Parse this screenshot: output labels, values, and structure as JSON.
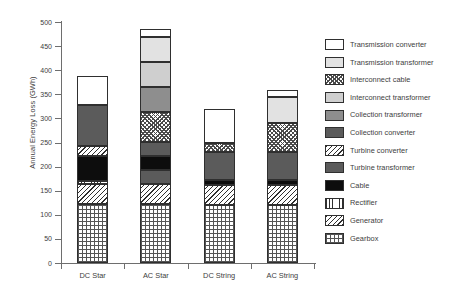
{
  "chart_data": {
    "type": "bar",
    "stacked": true,
    "title": "",
    "xlabel": "",
    "ylabel": "Annual Energy Loss (GWh)",
    "ylim": [
      0,
      500
    ],
    "yticks": [
      0,
      50,
      100,
      150,
      200,
      250,
      300,
      350,
      400,
      450,
      500
    ],
    "grid": false,
    "legend_position": "right",
    "categories": [
      "DC Star",
      "AC Star",
      "DC String",
      "AC String"
    ],
    "series": [
      {
        "name": "Gearbox",
        "pattern": "grid",
        "values": [
          122,
          122,
          121,
          121
        ]
      },
      {
        "name": "Generator",
        "pattern": "diag",
        "values": [
          41,
          41,
          40,
          40
        ]
      },
      {
        "name": "Rectifier",
        "pattern": "vert",
        "values": [
          8,
          0,
          0,
          0
        ]
      },
      {
        "name": "Cable",
        "pattern": "black",
        "values": [
          51,
          30,
          11,
          11
        ]
      },
      {
        "name": "Turbine transformer",
        "pattern": "darkgray",
        "values": [
          0,
          29,
          0,
          59
        ]
      },
      {
        "name": "Turbine converter",
        "pattern": "diag",
        "values": [
          21,
          62,
          18,
          60
        ]
      },
      {
        "name": "Collection converter",
        "pattern": "darkgray",
        "values": [
          84,
          30,
          58,
          0
        ]
      },
      {
        "name": "Collection transformer",
        "pattern": "gray",
        "values": [
          0,
          51,
          0,
          0
        ]
      },
      {
        "name": "Interconnect transformer",
        "pattern": "midgray",
        "values": [
          0,
          52,
          0,
          0
        ]
      },
      {
        "name": "Interconnect cable",
        "pattern": "checker",
        "values": [
          0,
          0,
          0,
          0
        ]
      },
      {
        "name": "Transmission transformer",
        "pattern": "lightgray",
        "values": [
          0,
          52,
          0,
          53
        ]
      },
      {
        "name": "Transmission converter",
        "pattern": "white",
        "values": [
          60,
          16,
          72,
          14
        ]
      }
    ],
    "totals": [
      387,
      485,
      320,
      358
    ],
    "bars": [
      {
        "category": "DC Star",
        "total": 387,
        "segments": [
          {
            "name": "Gearbox",
            "pattern": "grid",
            "start": 0,
            "end": 122,
            "value": 122
          },
          {
            "name": "Generator",
            "pattern": "diag",
            "start": 122,
            "end": 163,
            "value": 41
          },
          {
            "name": "Rectifier",
            "pattern": "vert",
            "start": 163,
            "end": 171,
            "value": 8
          },
          {
            "name": "Cable",
            "pattern": "black",
            "start": 171,
            "end": 222,
            "value": 51
          },
          {
            "name": "Turbine converter",
            "pattern": "diag",
            "start": 222,
            "end": 243,
            "value": 21
          },
          {
            "name": "Collection converter",
            "pattern": "darkgray",
            "start": 243,
            "end": 327,
            "value": 84
          },
          {
            "name": "Transmission converter",
            "pattern": "white",
            "start": 327,
            "end": 387,
            "value": 60
          }
        ]
      },
      {
        "category": "AC Star",
        "total": 485,
        "segments": [
          {
            "name": "Gearbox",
            "pattern": "grid",
            "start": 0,
            "end": 122,
            "value": 122
          },
          {
            "name": "Generator",
            "pattern": "diag",
            "start": 122,
            "end": 163,
            "value": 41
          },
          {
            "name": "Turbine transformer",
            "pattern": "darkgray",
            "start": 163,
            "end": 192,
            "value": 29
          },
          {
            "name": "Cable",
            "pattern": "black",
            "start": 192,
            "end": 222,
            "value": 30
          },
          {
            "name": "Collection converter",
            "pattern": "darkgray",
            "start": 222,
            "end": 252,
            "value": 30
          },
          {
            "name": "Turbine converter",
            "pattern": "checker",
            "start": 252,
            "end": 314,
            "value": 62
          },
          {
            "name": "Collection transformer",
            "pattern": "gray",
            "start": 314,
            "end": 365,
            "value": 51
          },
          {
            "name": "Interconnect transformer",
            "pattern": "midgray",
            "start": 365,
            "end": 417,
            "value": 52
          },
          {
            "name": "Transmission transformer",
            "pattern": "lightgray",
            "start": 417,
            "end": 469,
            "value": 52
          },
          {
            "name": "Transmission converter",
            "pattern": "white",
            "start": 469,
            "end": 485,
            "value": 16
          }
        ]
      },
      {
        "category": "DC String",
        "total": 320,
        "segments": [
          {
            "name": "Gearbox",
            "pattern": "grid",
            "start": 0,
            "end": 121,
            "value": 121
          },
          {
            "name": "Generator",
            "pattern": "diag",
            "start": 121,
            "end": 161,
            "value": 40
          },
          {
            "name": "Cable",
            "pattern": "black",
            "start": 161,
            "end": 172,
            "value": 11
          },
          {
            "name": "Collection converter",
            "pattern": "darkgray",
            "start": 172,
            "end": 230,
            "value": 58
          },
          {
            "name": "Turbine converter",
            "pattern": "checker",
            "start": 230,
            "end": 248,
            "value": 18
          },
          {
            "name": "Transmission converter",
            "pattern": "white",
            "start": 248,
            "end": 320,
            "value": 72
          }
        ]
      },
      {
        "category": "AC String",
        "total": 358,
        "segments": [
          {
            "name": "Gearbox",
            "pattern": "grid",
            "start": 0,
            "end": 121,
            "value": 121
          },
          {
            "name": "Generator",
            "pattern": "diag",
            "start": 121,
            "end": 161,
            "value": 40
          },
          {
            "name": "Cable",
            "pattern": "black",
            "start": 161,
            "end": 172,
            "value": 11
          },
          {
            "name": "Turbine transformer",
            "pattern": "darkgray",
            "start": 172,
            "end": 231,
            "value": 59
          },
          {
            "name": "Turbine converter",
            "pattern": "checker",
            "start": 231,
            "end": 291,
            "value": 60
          },
          {
            "name": "Transmission transformer",
            "pattern": "lightgray",
            "start": 291,
            "end": 344,
            "value": 53
          },
          {
            "name": "Transmission converter",
            "pattern": "white",
            "start": 344,
            "end": 358,
            "value": 14
          }
        ]
      }
    ],
    "legend": [
      {
        "label": "Transmission converter",
        "pattern": "white"
      },
      {
        "label": "Transmission transformer",
        "pattern": "lightgray"
      },
      {
        "label": "Interconnect cable",
        "pattern": "checker"
      },
      {
        "label": "Interconnect transformer",
        "pattern": "midgray"
      },
      {
        "label": "Collection transformer",
        "pattern": "gray"
      },
      {
        "label": "Collection converter",
        "pattern": "darkgray"
      },
      {
        "label": "Turbine converter",
        "pattern": "diag"
      },
      {
        "label": "Turbine transformer",
        "pattern": "darkgray"
      },
      {
        "label": "Cable",
        "pattern": "black"
      },
      {
        "label": "Rectifier",
        "pattern": "vert"
      },
      {
        "label": "Generator",
        "pattern": "diag"
      },
      {
        "label": "Gearbox",
        "pattern": "grid"
      }
    ]
  }
}
